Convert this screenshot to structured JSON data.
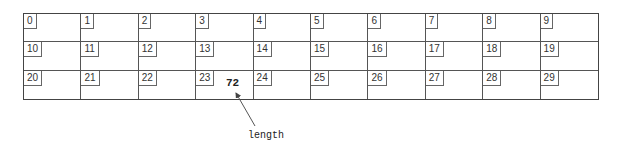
{
  "diagram": {
    "type": "memory-array",
    "rows": 3,
    "columns": 10,
    "cells": [
      "0",
      "1",
      "2",
      "3",
      "4",
      "5",
      "6",
      "7",
      "8",
      "9",
      "10",
      "11",
      "12",
      "13",
      "14",
      "15",
      "16",
      "17",
      "18",
      "19",
      "20",
      "21",
      "22",
      "23",
      "24",
      "25",
      "26",
      "27",
      "28",
      "29"
    ],
    "stored_value": {
      "cell": "23",
      "value": "72"
    },
    "annotation": {
      "label": "length",
      "points_to": "72"
    }
  }
}
